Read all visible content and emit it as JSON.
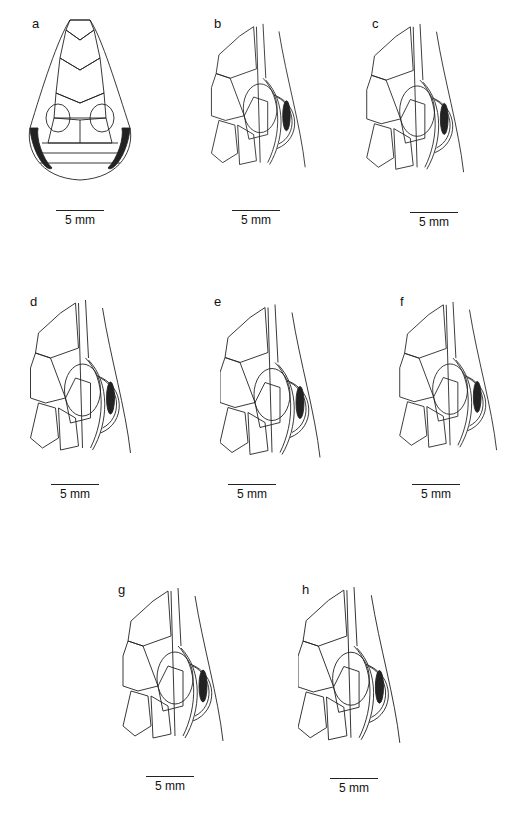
{
  "figure": {
    "panels": [
      {
        "id": "a",
        "label": "a",
        "view": "dorsal head",
        "scale": "5 mm"
      },
      {
        "id": "b",
        "label": "b",
        "view": "lateral head",
        "scale": "5 mm"
      },
      {
        "id": "c",
        "label": "c",
        "view": "lateral head",
        "scale": "5 mm"
      },
      {
        "id": "d",
        "label": "d",
        "view": "lateral head",
        "scale": "5 mm"
      },
      {
        "id": "e",
        "label": "e",
        "view": "lateral head",
        "scale": "5 mm"
      },
      {
        "id": "f",
        "label": "f",
        "view": "lateral head",
        "scale": "5 mm"
      },
      {
        "id": "g",
        "label": "g",
        "view": "lateral head",
        "scale": "5 mm"
      },
      {
        "id": "h",
        "label": "h",
        "view": "lateral head",
        "scale": "5 mm"
      }
    ]
  }
}
